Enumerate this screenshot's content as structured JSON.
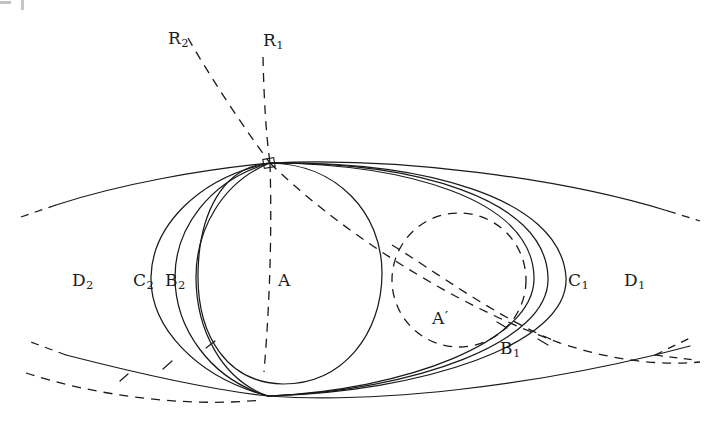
{
  "figure": {
    "background_color": "#ffffff",
    "ink_color": "#1a1a1a",
    "width": 718,
    "height": 424
  },
  "artifacts": {
    "corner_mark_left": "scan-artifact",
    "corner_mark_right": "scan-artifact"
  },
  "labels": {
    "circle_a": {
      "text": "A",
      "sub": "",
      "prime": ""
    },
    "circle_a_prime": {
      "text": "A",
      "sub": "",
      "prime": "′"
    },
    "region_b1": {
      "text": "B",
      "sub": "1",
      "prime": ""
    },
    "region_b2": {
      "text": "B",
      "sub": "2",
      "prime": ""
    },
    "region_c1": {
      "text": "C",
      "sub": "1",
      "prime": ""
    },
    "region_c2": {
      "text": "C",
      "sub": "2",
      "prime": ""
    },
    "region_d1": {
      "text": "D",
      "sub": "1",
      "prime": ""
    },
    "region_d2": {
      "text": "D",
      "sub": "2",
      "prime": ""
    },
    "ray_r1": {
      "text": "R",
      "sub": "1",
      "prime": ""
    },
    "ray_r2": {
      "text": "R",
      "sub": "2",
      "prime": ""
    }
  },
  "geometry": {
    "tangency_point_top": {
      "x": 270,
      "y": 163
    },
    "tangency_point_bottom": {
      "x": 268,
      "y": 396
    },
    "circle_a": {
      "cx": 290,
      "cy": 273,
      "r": 92,
      "style": "solid"
    },
    "circle_a_prime": {
      "cx": 459,
      "cy": 280,
      "r": 67,
      "style": "dashed"
    },
    "crossing_right": {
      "x": 655,
      "y": 355
    }
  }
}
